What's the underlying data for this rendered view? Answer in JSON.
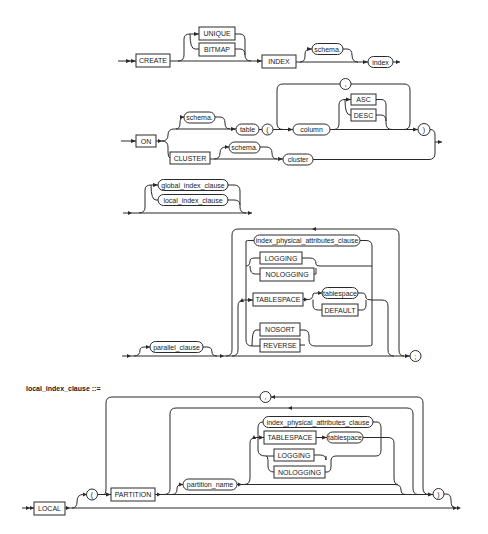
{
  "diagram": {
    "type": "railroad-syntax-diagram",
    "create_index": {
      "keywords": {
        "create": "CREATE",
        "unique": "UNIQUE",
        "bitmap": "BITMAP",
        "index": "INDEX",
        "on": "ON",
        "cluster": "CLUSTER",
        "asc": "ASC",
        "desc": "DESC",
        "logging": "LOGGING",
        "nologging": "NOLOGGING",
        "tablespace": "TABLESPACE",
        "default": "DEFAULT",
        "nosort": "NOSORT",
        "reverse": "REVERSE"
      },
      "nonterminals": {
        "schema1": "schema.",
        "index": "index",
        "schema2": "schema.",
        "table": "table",
        "column": "column",
        "schema3": "schema.",
        "cluster": "cluster",
        "global_index_clause": "global_index_clause",
        "local_index_clause": "local_index_clause",
        "index_physical_attributes_clause": "index_physical_attributes_clause",
        "tablespace": "tablespace",
        "parallel_clause": "parallel_clause"
      },
      "symbols": {
        "lparen": "(",
        "rparen": ")",
        "comma": ",",
        "semicolon": ";"
      }
    },
    "local_index_clause": {
      "title": "local_index_clause ::=",
      "keywords": {
        "local": "LOCAL",
        "partition": "PARTITION",
        "tablespace": "TABLESPACE",
        "logging": "LOGGING",
        "nologging": "NOLOGGING"
      },
      "nonterminals": {
        "partition_name": "partition_name",
        "index_physical_attributes_clause": "index_physical_attributes_clause",
        "tablespace": "tablespace"
      },
      "symbols": {
        "lparen": "(",
        "rparen": ")",
        "comma": ","
      }
    }
  }
}
